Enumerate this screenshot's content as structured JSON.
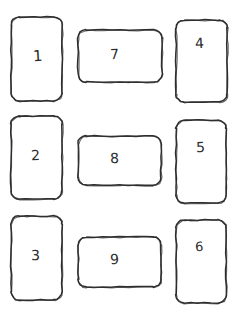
{
  "diagram": {
    "style": "sketch",
    "background_color": "#ffffff",
    "stroke_color": "#2f2f2f",
    "text_color": "#2b2b2b",
    "stroke_width": 2,
    "corner_radius": 8,
    "columns": 3,
    "rows": 3
  },
  "cards": [
    {
      "label": "1",
      "orientation": "portrait",
      "column": "left",
      "row": 1,
      "x": 11,
      "y": 17,
      "w": 51,
      "h": 84,
      "label_x": 33,
      "label_y": 49,
      "label_size": 15,
      "label_rotate": -3
    },
    {
      "label": "2",
      "orientation": "portrait",
      "column": "left",
      "row": 2,
      "x": 11,
      "y": 116,
      "w": 51,
      "h": 83,
      "label_x": 31,
      "label_y": 148,
      "label_size": 14,
      "label_rotate": -2
    },
    {
      "label": "3",
      "orientation": "portrait",
      "column": "left",
      "row": 3,
      "x": 11,
      "y": 216,
      "w": 51,
      "h": 84,
      "label_x": 31,
      "label_y": 248,
      "label_size": 14,
      "label_rotate": -2
    },
    {
      "label": "7",
      "orientation": "landscape",
      "column": "center",
      "row": 1,
      "x": 78,
      "y": 30,
      "w": 84,
      "h": 52,
      "label_x": 110,
      "label_y": 47,
      "label_size": 14,
      "label_rotate": -2
    },
    {
      "label": "8",
      "orientation": "landscape",
      "column": "center",
      "row": 2,
      "x": 78,
      "y": 136,
      "w": 83,
      "h": 49,
      "label_x": 110,
      "label_y": 151,
      "label_size": 14,
      "label_rotate": -2
    },
    {
      "label": "9",
      "orientation": "landscape",
      "column": "center",
      "row": 3,
      "x": 78,
      "y": 237,
      "w": 83,
      "h": 50,
      "label_x": 110,
      "label_y": 252,
      "label_size": 14,
      "label_rotate": -2
    },
    {
      "label": "4",
      "orientation": "portrait",
      "column": "right",
      "row": 1,
      "x": 176,
      "y": 20,
      "w": 51,
      "h": 82,
      "label_x": 195,
      "label_y": 36,
      "label_size": 14,
      "label_rotate": -3
    },
    {
      "label": "5",
      "orientation": "portrait",
      "column": "right",
      "row": 2,
      "x": 176,
      "y": 120,
      "w": 50,
      "h": 83,
      "label_x": 196,
      "label_y": 140,
      "label_size": 14,
      "label_rotate": -2
    },
    {
      "label": "6",
      "orientation": "portrait",
      "column": "right",
      "row": 3,
      "x": 176,
      "y": 220,
      "w": 50,
      "h": 83,
      "label_x": 195,
      "label_y": 240,
      "label_size": 13,
      "label_rotate": -2
    }
  ]
}
